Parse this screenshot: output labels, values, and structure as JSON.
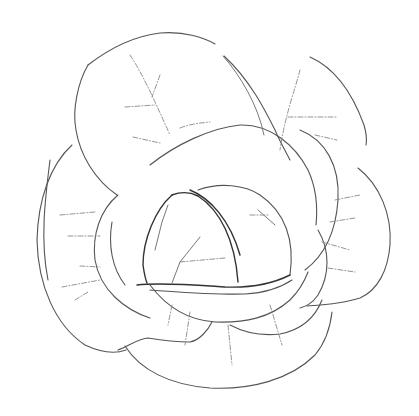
{
  "illustration": {
    "subject": "cabbage line drawing",
    "style": "pencil outline sketch on white",
    "colors": {
      "background": "#ffffff",
      "line": "#555555",
      "line_dark": "#333333",
      "vein": "#888888"
    },
    "parts": [
      "outer-leaves",
      "middle-leaves",
      "inner-head",
      "leaf-veins"
    ]
  }
}
